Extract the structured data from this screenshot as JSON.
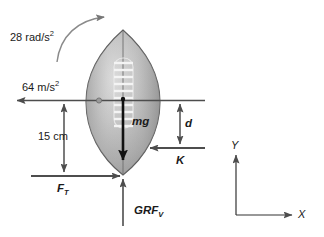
{
  "figure": {
    "background_color": "#ffffff",
    "stroke_color": "#4d4d4d",
    "dark_stroke_color": "#111111",
    "text_color": "#1a1a1a"
  },
  "ball": {
    "name": "football",
    "fill_light": "#d9d9d9",
    "fill_mid": "#b3b3b3",
    "fill_dark": "#8c8c8c",
    "outline": "#555555",
    "lace_color": "#f2f2f2",
    "lace_count": 10,
    "center_x": 123,
    "center_y": 100
  },
  "labels": {
    "angular_acceleration": {
      "value": "28",
      "unit": "rad/s",
      "exponent": "2",
      "full": "28 rad/s2"
    },
    "linear_acceleration": {
      "value": "64",
      "unit": "m/s",
      "exponent": "2",
      "full": "64 m/s2"
    },
    "distance_vertical": {
      "value": "15",
      "unit": "cm",
      "full": "15 cm"
    },
    "weight_force": {
      "symbol": "mg"
    },
    "tangential_force": {
      "symbol": "F",
      "subscript": "T",
      "full": "FT"
    },
    "ground_reaction_force": {
      "symbol": "GRF",
      "subscript": "V",
      "full": "GRFV"
    },
    "k_force": {
      "symbol": "K"
    },
    "moment_arm": {
      "symbol": "d"
    },
    "axis_x": {
      "symbol": "X"
    },
    "axis_y": {
      "symbol": "Y"
    }
  },
  "vectors": [
    {
      "name": "acceleration-arrow-left",
      "direction": "left",
      "label": "64 m/s2"
    },
    {
      "name": "weight-arrow-down",
      "direction": "down",
      "label": "mg"
    },
    {
      "name": "tangential-force-arrow-right",
      "direction": "right",
      "label": "FT"
    },
    {
      "name": "ground-reaction-arrow-up",
      "direction": "up",
      "label": "GRFV"
    },
    {
      "name": "k-force-arrow-left",
      "direction": "left",
      "label": "K"
    },
    {
      "name": "angular-acceleration-arc",
      "direction": "clockwise",
      "label": "28 rad/s2"
    }
  ],
  "dimensions": [
    {
      "name": "vertical-distance-15cm",
      "label": "15 cm",
      "orientation": "vertical"
    },
    {
      "name": "moment-arm-d",
      "label": "d",
      "orientation": "vertical"
    }
  ]
}
